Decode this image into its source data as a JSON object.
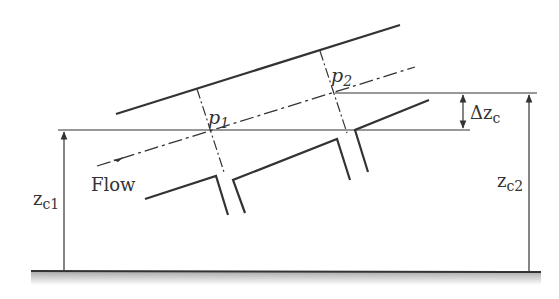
{
  "diagram": {
    "type": "inclined pipe with two pressure taps",
    "labels": {
      "p1": "p",
      "p1_sub": "1",
      "p2": "p",
      "p2_sub": "2",
      "flow": "Flow",
      "delta_zc": "Δz",
      "delta_zc_sub": "c",
      "zc1": "z",
      "zc1_sub": "c1",
      "zc2": "z",
      "zc2_sub": "c2"
    },
    "colors": {
      "stroke": "#333333",
      "ground_shade": "#bdbdbd",
      "background": "#ffffff"
    }
  }
}
